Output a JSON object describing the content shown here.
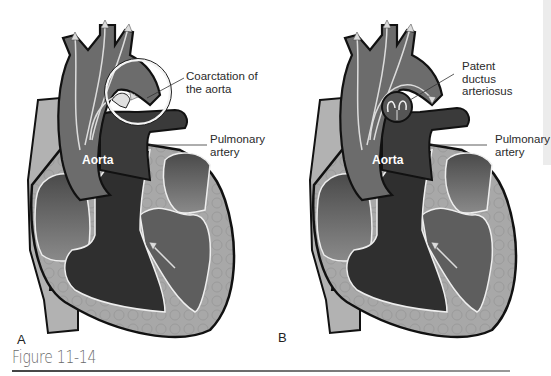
{
  "figure": {
    "caption": "Figure 11-14",
    "panels": [
      {
        "letter": "A",
        "aorta_label": "Aorta",
        "callouts": [
          {
            "id": "coarctation",
            "text_line1": "Coarctation of",
            "text_line2": "the aorta"
          },
          {
            "id": "pulmonary",
            "text_line1": "Pulmonary",
            "text_line2": "artery"
          }
        ]
      },
      {
        "letter": "B",
        "aorta_label": "Aorta",
        "callouts": [
          {
            "id": "pda",
            "text_line1": "Patent ductus",
            "text_line2": "arteriosus"
          },
          {
            "id": "pulmonary",
            "text_line1": "Pulmonary",
            "text_line2": "artery"
          }
        ]
      }
    ]
  },
  "colors": {
    "background": "#ffffff",
    "muscle_wall": "#a9a9a9",
    "aorta_fill": "#6e6e6e",
    "pulmonary_fill": "#3a3a3a",
    "chamber_mid": "#5c5c5c",
    "outline": "#111111",
    "arrow_light": "#d8d8d8"
  }
}
